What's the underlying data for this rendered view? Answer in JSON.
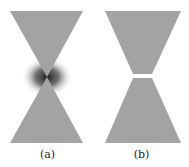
{
  "figure": {
    "panels": [
      {
        "id": "a",
        "caption": "(a)",
        "description": "Bowtie with tips touching and dark gradient shading at the junction"
      },
      {
        "id": "b",
        "caption": "(b)",
        "description": "Truncated bowtie with a small gap between the two tips"
      }
    ],
    "colors": {
      "shape_fill": "#a3a3a3",
      "shadow": "#1e1e1e",
      "background": "#ffffff"
    }
  }
}
